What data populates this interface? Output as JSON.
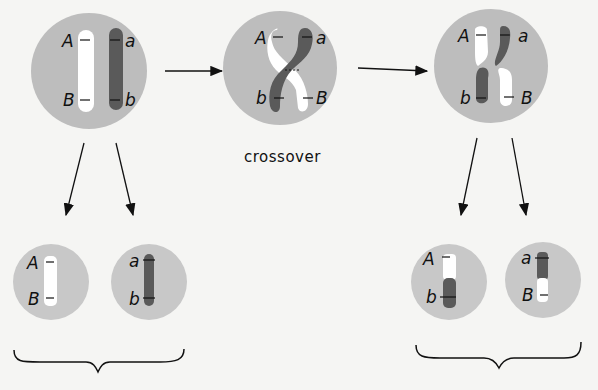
{
  "diagram": {
    "caption": "crossover",
    "colors": {
      "background": "#f5f5f3",
      "cell": "#bdbdbd",
      "cell_small": "#c8c8c8",
      "dark_chromosome": "#5a5a5a",
      "light_chromosome": "#ffffff",
      "ink": "#111111"
    },
    "stages": [
      {
        "name": "parent-cell",
        "labels": {
          "top_left": "A",
          "bottom_left": "B",
          "top_right": "a",
          "bottom_right": "b"
        }
      },
      {
        "name": "crossover-cell",
        "labels": {
          "top_left": "A",
          "bottom_left": "b",
          "top_right": "a",
          "bottom_right": "B"
        }
      },
      {
        "name": "recombined-cell",
        "labels": {
          "top_left": "A",
          "bottom_left": "b",
          "top_right": "a",
          "bottom_right": "B"
        }
      }
    ],
    "gametes_left": [
      {
        "name": "gamete-AB",
        "labels": {
          "top": "A",
          "bottom": "B"
        }
      },
      {
        "name": "gamete-ab",
        "labels": {
          "top": "a",
          "bottom": "b"
        }
      }
    ],
    "gametes_right": [
      {
        "name": "gamete-Ab",
        "labels": {
          "top": "A",
          "bottom": "b"
        }
      },
      {
        "name": "gamete-aB",
        "labels": {
          "top": "a",
          "bottom": "B"
        }
      }
    ]
  }
}
